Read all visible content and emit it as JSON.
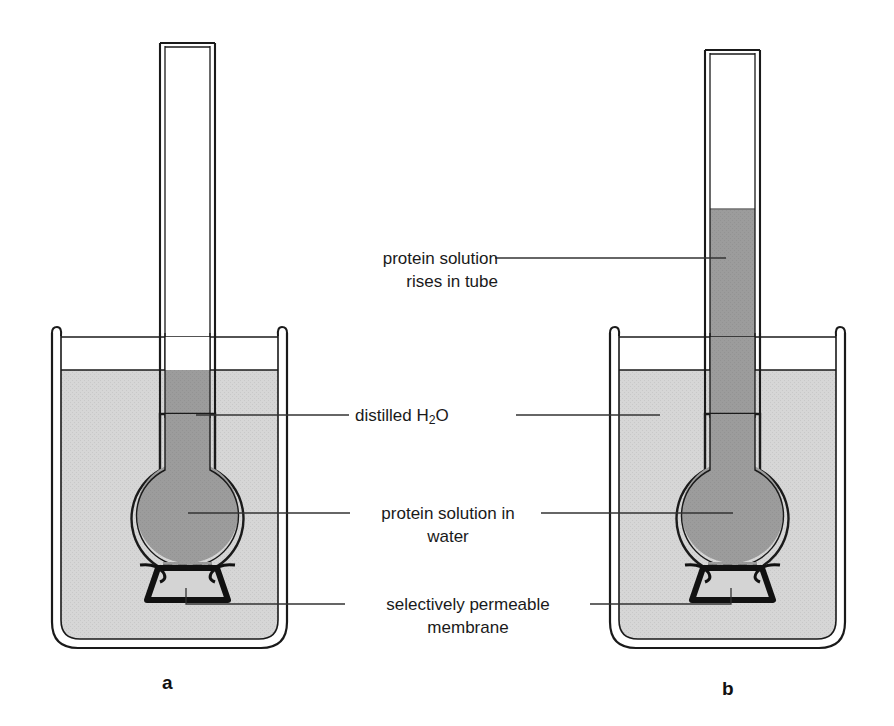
{
  "figure": {
    "type": "scientific-diagram",
    "background_color": "#ffffff"
  },
  "colors": {
    "water_fill": "#d4d4d4",
    "protein_fill": "#9a9a9a",
    "glass_stroke": "#1a1a1a",
    "membrane_fill": "#111111",
    "label_text": "#1a1a1a",
    "leader_line": "#333333"
  },
  "labels": {
    "rises_in_tube": {
      "line1": "protein solution",
      "line2": "rises in tube"
    },
    "distilled_water": {
      "line1_pre": "distilled H",
      "line1_sub": "2",
      "line1_post": "O"
    },
    "protein_solution": {
      "line1": "protein solution in",
      "line2": "water"
    },
    "membrane": {
      "line1": "selectively permeable",
      "line2": "membrane"
    }
  },
  "panels": [
    {
      "id": "a",
      "letter": "a",
      "tube_fluid_level": "none",
      "tube_fluid_top_y": 370,
      "description": "starting state - no rise in tube"
    },
    {
      "id": "b",
      "letter": "b",
      "tube_fluid_level": "raised",
      "tube_fluid_top_y": 209,
      "description": "after osmosis - protein solution has risen in the tube"
    }
  ]
}
